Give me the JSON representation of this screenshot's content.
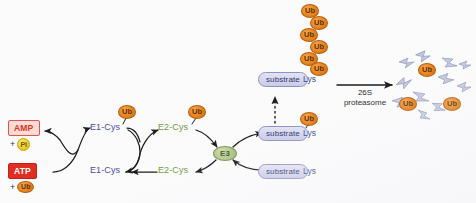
{
  "diagram": {
    "background_color": "#fbfbfc"
  },
  "colors": {
    "ubiquitin_fill": "#e8882a",
    "ubiquitin_text": "#5d3000",
    "e1_text": "#4a4fa0",
    "e2_text": "#6f9a42",
    "e3_fill": "#b9cb92",
    "e3_text": "#46602a",
    "substrate_fill": "#d3d5ea",
    "substrate_text": "#2e3570",
    "atp_fill": "#e02f22",
    "amp_fill": "#fbdcd4",
    "amp_text": "#d8352a",
    "pi_fill": "#ecc916",
    "arrow_stroke": "#1d1d1d",
    "fragment_fill": "#c3cade"
  },
  "energy": {
    "products": {
      "label": "AMP",
      "plus": "+",
      "chip": "Pi",
      "chip_icon": "phosphate-icon"
    },
    "reactants": {
      "label": "ATP",
      "plus": "+",
      "chip": "Ub",
      "chip_icon": "ubiquitin-icon"
    }
  },
  "cycle_e1": {
    "top_label": "E1-Cys",
    "bottom_label": "E1-Cys",
    "ubiquitin": "Ub"
  },
  "cycle_e2": {
    "top_label": "E2-Cys",
    "bottom_label": "E2-Cys",
    "ubiquitin": "Ub"
  },
  "ligase": {
    "label": "E3"
  },
  "substrates": [
    {
      "box": "substrate",
      "residue": "Lys",
      "ubiquitin": "Ub",
      "state": "polyubiquitinated"
    },
    {
      "box": "substrate",
      "residue": "Lys",
      "ubiquitin": "Ub",
      "state": "monoubiquitinated"
    },
    {
      "box": "substrate",
      "residue": "Lys",
      "ubiquitin": null,
      "state": "unmodified"
    }
  ],
  "polyubiquitin_chain": {
    "unit_label": "Ub",
    "count": 6
  },
  "proteasome": {
    "line1": "26S",
    "line2": "proteasome"
  },
  "products": {
    "free_ubiquitin_label": "Ub",
    "free_ubiquitin_count": 3,
    "peptide_fragment_count": 11
  }
}
